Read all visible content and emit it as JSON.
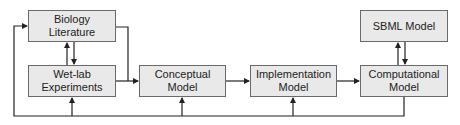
{
  "diagram": {
    "nodes": [
      {
        "id": "biology-literature",
        "lines": [
          "Biology",
          "Literature"
        ]
      },
      {
        "id": "wet-lab-experiments",
        "lines": [
          "Wet-lab",
          "Experiments"
        ]
      },
      {
        "id": "conceptual-model",
        "lines": [
          "Conceptual",
          "Model"
        ]
      },
      {
        "id": "implementation-model",
        "lines": [
          "Implementation",
          "Model"
        ]
      },
      {
        "id": "computational-model",
        "lines": [
          "Computational",
          "Model"
        ]
      },
      {
        "id": "sbml-model",
        "lines": [
          "SBML Model"
        ]
      }
    ],
    "edges": [
      {
        "from": "biology-literature",
        "to": "wet-lab-experiments"
      },
      {
        "from": "wet-lab-experiments",
        "to": "biology-literature"
      },
      {
        "from": "biology-literature",
        "to": "conceptual-model"
      },
      {
        "from": "wet-lab-experiments",
        "to": "conceptual-model"
      },
      {
        "from": "conceptual-model",
        "to": "implementation-model"
      },
      {
        "from": "implementation-model",
        "to": "computational-model"
      },
      {
        "from": "computational-model",
        "to": "sbml-model"
      },
      {
        "from": "sbml-model",
        "to": "computational-model"
      },
      {
        "from": "computational-model",
        "to": "biology-literature",
        "label": "feedback loop"
      },
      {
        "from": "computational-model",
        "to": "wet-lab-experiments",
        "label": "feedback loop"
      },
      {
        "from": "computational-model",
        "to": "conceptual-model",
        "label": "feedback loop"
      },
      {
        "from": "computational-model",
        "to": "implementation-model",
        "label": "feedback loop"
      }
    ],
    "colors": {
      "box_fill": "#e9e9e9",
      "box_border": "#6a6a6a",
      "line": "#222222",
      "text": "#222222"
    }
  }
}
